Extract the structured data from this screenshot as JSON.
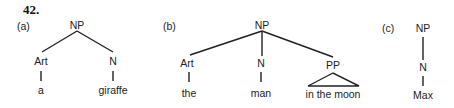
{
  "example_number": "42.",
  "trees": [
    {
      "label": "(a)",
      "root": "NP",
      "children": [
        {
          "category": "Art",
          "word": "a"
        },
        {
          "category": "N",
          "word": "giraffe"
        }
      ]
    },
    {
      "label": "(b)",
      "root": "NP",
      "children": [
        {
          "category": "Art",
          "word": "the"
        },
        {
          "category": "N",
          "word": "man"
        },
        {
          "category": "PP",
          "word": "in the moon",
          "triangle": true
        }
      ]
    },
    {
      "label": "(c)",
      "root": "NP",
      "children": [
        {
          "category": "N",
          "word": "Max"
        }
      ]
    }
  ]
}
